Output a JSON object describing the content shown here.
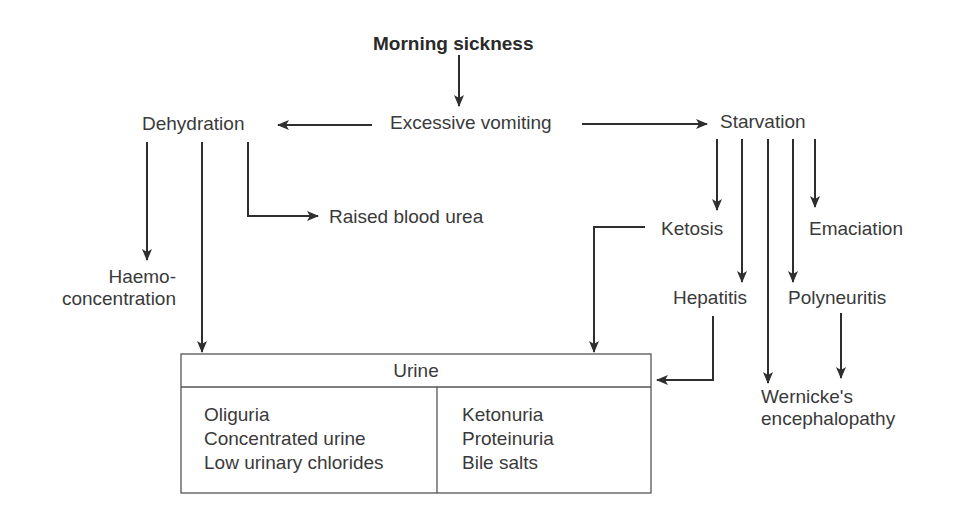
{
  "diagram": {
    "root": "Morning sickness",
    "center": "Excessive vomiting",
    "left_node": "Dehydration",
    "right_node": "Starvation",
    "raised_urea": "Raised blood urea",
    "haemo_line1": "Haemo-",
    "haemo_line2": "concentration",
    "ketosis": "Ketosis",
    "emaciation": "Emaciation",
    "hepatitis": "Hepatitis",
    "polyneuritis": "Polyneuritis",
    "wernicke_line1": "Wernicke's",
    "wernicke_line2": "encephalopathy",
    "urine_box": {
      "title": "Urine",
      "left_items": [
        "Oliguria",
        "Concentrated urine",
        "Low urinary chlorides"
      ],
      "right_items": [
        "Ketonuria",
        "Proteinuria",
        "Bile salts"
      ]
    }
  },
  "colors": {
    "line": "#2e2e2e",
    "text": "#3a3a3a",
    "background": "#ffffff"
  }
}
